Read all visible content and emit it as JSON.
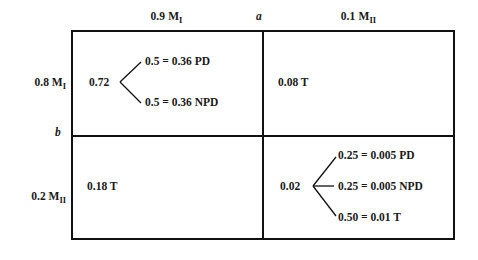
{
  "figure": {
    "type": "probability-matrix-with-branch-trees",
    "columns": [
      {
        "id": "col-left",
        "prob": "0.9",
        "state": "M",
        "state_subscript": "I",
        "label": "0.9 M_I"
      },
      {
        "id": "col-right",
        "prob": "0.1",
        "state": "M",
        "state_subscript": "II",
        "label": "0.1 M_II"
      }
    ],
    "rows": [
      {
        "id": "row-top",
        "prob": "0.8",
        "state": "M",
        "state_subscript": "I",
        "label": "0.8 M_I"
      },
      {
        "id": "row-bottom",
        "prob": "0.2",
        "state": "M",
        "state_subscript": "II",
        "label": "0.2 M_II"
      }
    ],
    "divider_labels": {
      "vertical": "a",
      "horizontal": "b"
    },
    "cells": [
      {
        "id": "cell-top-left",
        "row": "row-top",
        "column": "col-left",
        "kind": "tree",
        "root": "0.72",
        "branches": [
          {
            "prob": "0.5",
            "eq": "=",
            "value": "0.36",
            "outcome": "PD",
            "text": "0.5 = 0.36 PD"
          },
          {
            "prob": "0.5",
            "eq": "=",
            "value": "0.36",
            "outcome": "NPD",
            "text": "0.5 = 0.36 NPD"
          }
        ]
      },
      {
        "id": "cell-top-right",
        "row": "row-top",
        "column": "col-right",
        "kind": "value",
        "value": "0.08",
        "outcome": "T",
        "text": "0.08 T"
      },
      {
        "id": "cell-bottom-left",
        "row": "row-bottom",
        "column": "col-left",
        "kind": "value",
        "value": "0.18",
        "outcome": "T",
        "text": "0.18 T"
      },
      {
        "id": "cell-bottom-right",
        "row": "row-bottom",
        "column": "col-right",
        "kind": "tree",
        "root": "0.02",
        "branches": [
          {
            "prob": "0.25",
            "eq": "=",
            "value": "0.005",
            "outcome": "PD",
            "text": "0.25 = 0.005 PD"
          },
          {
            "prob": "0.25",
            "eq": "=",
            "value": "0.005",
            "outcome": "NPD",
            "text": "0.25 = 0.005 NPD"
          },
          {
            "prob": "0.50",
            "eq": "=",
            "value": "0.01",
            "outcome": "T",
            "text": "0.50 = 0.01 T"
          }
        ]
      }
    ],
    "colors": {
      "ink": "#111111",
      "background": "#ffffff"
    }
  }
}
